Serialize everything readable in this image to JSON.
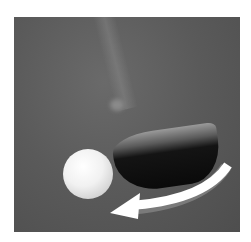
{
  "image": {
    "description": "Golf club head swinging toward a golf ball with a curved white arrow indicating the swing path",
    "elements": [
      "golf-ball",
      "golf-club-head",
      "club-shaft",
      "swing-arrow"
    ],
    "colors": {
      "background": "#5a5a5a",
      "ball": "#f1f1f1",
      "club_face": "#0a0a0a",
      "arrow": "#ffffff"
    }
  }
}
